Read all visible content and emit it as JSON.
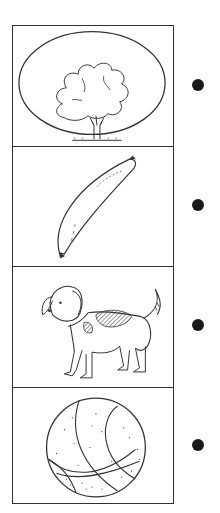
{
  "worksheet": {
    "type": "picture-matching",
    "panels": [
      {
        "label": "tree",
        "icon": "tree-in-oval"
      },
      {
        "label": "banana",
        "icon": "banana"
      },
      {
        "label": "dog",
        "icon": "spotted-dog"
      },
      {
        "label": "ball",
        "icon": "basketball"
      }
    ],
    "dots_count": 4,
    "colors": {
      "line": "#333333",
      "dot": "#1a1a1a",
      "background": "#ffffff"
    }
  }
}
